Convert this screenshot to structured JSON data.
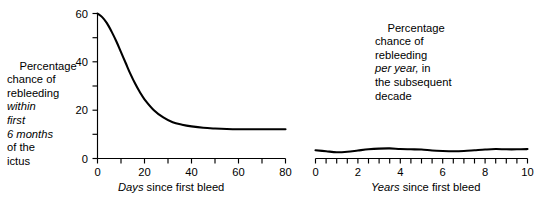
{
  "figure": {
    "background_color": "#ffffff",
    "ink_color": "#000000"
  },
  "panels": {
    "left": {
      "ylabel_lines": [
        {
          "text": "Percentage",
          "italic": false
        },
        {
          "text": "chance of",
          "italic": false
        },
        {
          "text": "rebleeding",
          "italic": false
        },
        {
          "text": "within",
          "italic": true
        },
        {
          "text": "first",
          "italic": true
        },
        {
          "text": "6 months",
          "italic": true
        },
        {
          "text": "of the",
          "italic": false
        },
        {
          "text": "ictus",
          "italic": false
        }
      ],
      "xtitle_italic": "Days",
      "xtitle_roman": " since first bleed",
      "ytick_labels": [
        "0",
        "20",
        "40",
        "60"
      ],
      "xtick_labels": [
        "0",
        "20",
        "40",
        "60",
        "80"
      ]
    },
    "right": {
      "label_lines": [
        {
          "text": "Percentage",
          "italic": false
        },
        {
          "text": "chance of",
          "italic": false
        },
        {
          "text": "rebleeding",
          "italic": false
        },
        {
          "text": "per year,",
          "italic": true,
          "suffix": " in"
        },
        {
          "text": "the subsequent",
          "italic": false
        },
        {
          "text": "decade",
          "italic": false
        }
      ],
      "xtitle_italic": "Years",
      "xtitle_roman": " since first bleed",
      "xtick_labels": [
        "0",
        "2",
        "4",
        "6",
        "8",
        "10"
      ]
    }
  },
  "chart_data": [
    {
      "type": "line",
      "id": "rebleeding-within-first-6-months",
      "title": "",
      "xlabel": "Days since first bleed",
      "ylabel": "Percentage chance of rebleeding within first 6 months of the ictus",
      "xlim": [
        0,
        80
      ],
      "ylim": [
        0,
        60
      ],
      "xticks": [
        0,
        10,
        20,
        30,
        40,
        50,
        60,
        70,
        80
      ],
      "xtick_labels_shown": [
        0,
        20,
        40,
        60,
        80
      ],
      "yticks": [
        0,
        10,
        20,
        30,
        40,
        50,
        60
      ],
      "ytick_labels_shown": [
        0,
        20,
        40,
        60
      ],
      "grid": false,
      "legend": false,
      "x": [
        0,
        2,
        4,
        6,
        8,
        10,
        12,
        14,
        16,
        18,
        20,
        24,
        28,
        32,
        36,
        40,
        45,
        50,
        55,
        60,
        65,
        70,
        75,
        80
      ],
      "y": [
        60,
        58.5,
        56,
        52.5,
        48.5,
        44,
        39.5,
        35,
        31,
        27.5,
        24.5,
        20,
        17,
        15,
        14,
        13.3,
        12.7,
        12.4,
        12.2,
        12.1,
        12.1,
        12.1,
        12.1,
        12.1
      ]
    },
    {
      "type": "line",
      "id": "rebleeding-per-year-subsequent-decade",
      "title": "",
      "xlabel": "Years since first bleed",
      "ylabel": "Percentage chance of rebleeding per year, in the subsequent decade",
      "xlim": [
        0,
        10
      ],
      "ylim": [
        0,
        60
      ],
      "xticks": [
        0,
        0.5,
        1,
        1.5,
        2,
        2.5,
        3,
        3.5,
        4,
        4.5,
        5,
        5.5,
        6,
        6.5,
        7,
        7.5,
        8,
        8.5,
        9,
        9.5,
        10
      ],
      "xtick_labels_shown": [
        0,
        2,
        4,
        6,
        8,
        10
      ],
      "yticks": [],
      "ytick_labels_shown": [],
      "grid": false,
      "legend": false,
      "y_axis_drawn": false,
      "x": [
        0,
        0.5,
        1,
        1.5,
        2,
        2.5,
        3,
        3.5,
        4,
        4.5,
        5,
        5.5,
        6,
        6.5,
        7,
        7.5,
        8,
        8.5,
        9,
        9.5,
        10
      ],
      "y": [
        3.4,
        3.0,
        2.6,
        2.8,
        3.3,
        3.8,
        4.1,
        4.2,
        3.9,
        3.8,
        3.7,
        3.3,
        3.1,
        3.0,
        3.1,
        3.4,
        3.7,
        3.9,
        3.8,
        3.8,
        3.9
      ]
    }
  ]
}
